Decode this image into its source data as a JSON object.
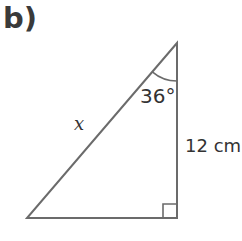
{
  "part": {
    "label": "b)"
  },
  "triangle": {
    "type": "right-angled",
    "vertices": {
      "top": [
        177,
        43
      ],
      "bottom_left": [
        27,
        218
      ],
      "bottom_right": [
        177,
        218
      ]
    },
    "right_angle_at": "bottom_right",
    "angle_marker": {
      "vertex": "top",
      "label": "36°"
    },
    "sides": {
      "hypotenuse": {
        "label": "x",
        "italic": true
      },
      "vertical": {
        "label": "12 cm"
      }
    },
    "line_color": "#6b6b6b"
  }
}
